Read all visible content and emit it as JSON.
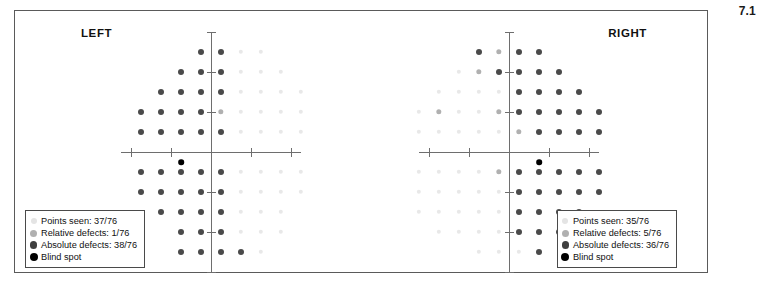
{
  "figure": {
    "number": "7.1"
  },
  "chart_data": {
    "type": "scatter",
    "grid_spacing_deg": 10,
    "categories": [
      "Points seen",
      "Relative defects",
      "Absolute defects",
      "Blind spot"
    ],
    "colors": {
      "seen": "#e8e8e8",
      "relative": "#b0b0b0",
      "absolute": "#4a4a4a",
      "blind_spot": "#000000",
      "axis": "#6e6e6e",
      "frame": "#5a5a5a"
    },
    "axis": {
      "grid": false,
      "xlim": [
        -9,
        9
      ],
      "ylim": [
        -6,
        6
      ],
      "tick_step": 2,
      "legend_position": "inside-bottom"
    },
    "panels": [
      {
        "eye": "left",
        "label": "LEFT",
        "total_points": 76,
        "points_seen": 37,
        "relative_defects": 1,
        "absolute_defects": 38,
        "blind_spot": {
          "x": -3,
          "y": -0.5
        },
        "rows": [
          {
            "y": 5,
            "absolute": [
              -1,
              1
            ],
            "relative": [],
            "seen": [
              3,
              5
            ]
          },
          {
            "y": 4,
            "absolute": [
              -3,
              -1,
              1
            ],
            "relative": [],
            "seen": [
              3,
              5,
              7
            ]
          },
          {
            "y": 3,
            "absolute": [
              -5,
              -3,
              -1,
              1
            ],
            "relative": [],
            "seen": [
              3,
              5,
              7,
              9
            ]
          },
          {
            "y": 2,
            "absolute": [
              -7,
              -5,
              -3,
              -1
            ],
            "relative": [
              1
            ],
            "seen": [
              3,
              5,
              7,
              9
            ]
          },
          {
            "y": 1,
            "absolute": [
              -7,
              -5,
              -3,
              -1,
              1
            ],
            "relative": [],
            "seen": [
              3,
              5,
              7,
              9
            ]
          },
          {
            "y": -1,
            "absolute": [
              -7,
              -5,
              -3,
              -1,
              1
            ],
            "relative": [],
            "seen": [
              3,
              5,
              7,
              9
            ]
          },
          {
            "y": -2,
            "absolute": [
              -7,
              -5,
              -3,
              -1,
              1
            ],
            "relative": [],
            "seen": [
              3,
              5,
              7,
              9
            ]
          },
          {
            "y": -3,
            "absolute": [
              -5,
              -3,
              -1,
              1
            ],
            "relative": [],
            "seen": [
              3,
              5,
              7
            ]
          },
          {
            "y": -4,
            "absolute": [
              -3,
              -1,
              1
            ],
            "relative": [],
            "seen": [
              3,
              5,
              7
            ]
          },
          {
            "y": -5,
            "absolute": [
              -3,
              -1,
              1,
              3
            ],
            "relative": [],
            "seen": [
              5
            ]
          }
        ],
        "legend": {
          "seen": "Points seen: 37/76",
          "relative": "Relative defects: 1/76",
          "absolute": "Absolute defects: 38/76",
          "blind": "Blind spot"
        }
      },
      {
        "eye": "right",
        "label": "RIGHT",
        "total_points": 76,
        "points_seen": 35,
        "relative_defects": 5,
        "absolute_defects": 36,
        "blind_spot": {
          "x": 3,
          "y": -0.5
        },
        "rows": [
          {
            "y": 5,
            "absolute": [
              -3,
              1,
              3
            ],
            "relative": [
              -1
            ],
            "seen": []
          },
          {
            "y": 4,
            "absolute": [
              -1,
              1,
              3,
              5
            ],
            "relative": [
              -3
            ],
            "seen": [
              -5
            ]
          },
          {
            "y": 3,
            "absolute": [
              1,
              3,
              5,
              7
            ],
            "relative": [],
            "seen": [
              -7,
              -5,
              -3,
              -1
            ]
          },
          {
            "y": 2,
            "absolute": [
              1,
              3,
              5,
              7,
              9
            ],
            "relative": [
              -7,
              -1
            ],
            "seen": [
              -9,
              -5,
              -3
            ]
          },
          {
            "y": 1,
            "absolute": [
              3,
              5,
              7,
              9
            ],
            "relative": [
              1
            ],
            "seen": [
              -9,
              -7,
              -5,
              -3,
              -1
            ]
          },
          {
            "y": -1,
            "absolute": [
              1,
              3,
              5,
              7,
              9
            ],
            "relative": [
              -1
            ],
            "seen": [
              -9,
              -7,
              -5,
              -3
            ]
          },
          {
            "y": -2,
            "absolute": [
              1,
              3,
              5,
              7,
              9
            ],
            "relative": [],
            "seen": [
              -9,
              -7,
              -5,
              -3,
              -1
            ]
          },
          {
            "y": -3,
            "absolute": [
              1,
              3,
              5,
              7
            ],
            "relative": [],
            "seen": [
              -9,
              -7,
              -5,
              -3,
              -1
            ]
          },
          {
            "y": -4,
            "absolute": [
              1,
              3,
              5
            ],
            "relative": [],
            "seen": [
              -7,
              -5,
              -3,
              -1
            ]
          },
          {
            "y": -5,
            "absolute": [
              3
            ],
            "relative": [],
            "seen": [
              -3,
              -1,
              1
            ]
          }
        ],
        "legend": {
          "seen": "Points seen: 35/76",
          "relative": "Relative defects: 5/76",
          "absolute": "Absolute defects: 36/76",
          "blind": "Blind spot"
        }
      }
    ]
  }
}
